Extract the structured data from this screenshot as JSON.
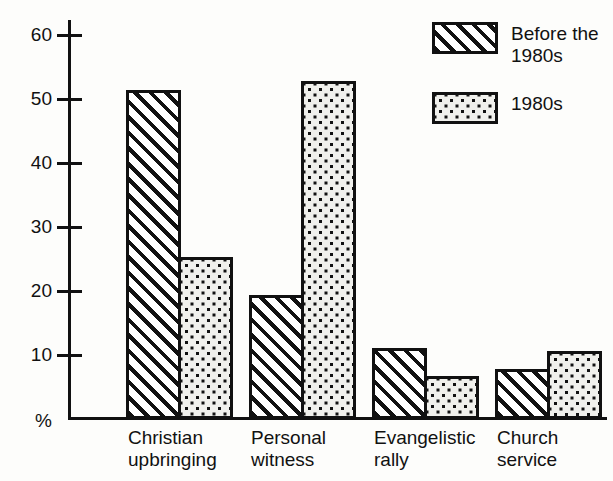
{
  "chart_data": {
    "type": "bar",
    "title": "",
    "subtitle": "",
    "xlabel": "",
    "ylabel": "%",
    "ylim": [
      0,
      62
    ],
    "grid": false,
    "legend_position": "top-right",
    "y_unit_symbol": "%",
    "yticks": [
      10,
      20,
      30,
      40,
      50,
      60
    ],
    "ytick_labels": [
      "10",
      "20",
      "30",
      "40",
      "50",
      "60"
    ],
    "categories": [
      "Christian\nupbringing",
      "Personal\nwitness",
      "Evangelistic\nrally",
      "Church\nservice"
    ],
    "series": [
      {
        "name": "Before the\n1980s",
        "pattern": "hatch",
        "values": [
          51.3,
          19.2,
          10.9,
          7.6
        ]
      },
      {
        "name": "1980s",
        "pattern": "dots",
        "values": [
          25.1,
          52.6,
          6.6,
          10.5
        ]
      }
    ]
  },
  "colors": {
    "ink": "#111111",
    "paper": "#fdfdfb",
    "hatch_fill": "#ffffff",
    "dots_fill": "#f0f0ec"
  }
}
